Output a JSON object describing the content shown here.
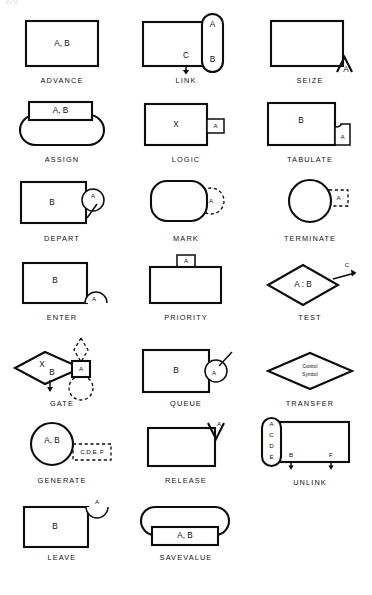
{
  "page": {
    "number": "370"
  },
  "document": {
    "title": "GPSS Block Symbols",
    "ink_color": "#0d0d0d",
    "paper_color": "#ffffff"
  },
  "rows": [
    {
      "cells": [
        {
          "name": "advance",
          "caption": "ADVANCE",
          "operands": [
            "A, B"
          ],
          "shape": "rectangle"
        },
        {
          "name": "link",
          "caption": "LINK",
          "operands": [
            "A",
            "B",
            "C"
          ],
          "shape": "rectangle-with-capsule"
        },
        {
          "name": "seize",
          "caption": "SEIZE",
          "operands": [
            "A"
          ],
          "shape": "rectangle-with-caret"
        }
      ]
    },
    {
      "cells": [
        {
          "name": "assign",
          "caption": "ASSIGN",
          "operands": [
            "A, B"
          ],
          "shape": "rectangle-over-capsule"
        },
        {
          "name": "logic",
          "caption": "LOGIC",
          "operands": [
            "X",
            "A"
          ],
          "shape": "rectangle-with-tab"
        },
        {
          "name": "tabulate",
          "caption": "TABULATE",
          "operands": [
            "B",
            "A"
          ],
          "shape": "rectangle-with-dogear"
        }
      ]
    },
    {
      "cells": [
        {
          "name": "depart",
          "caption": "DEPART",
          "operands": [
            "B",
            "A"
          ],
          "shape": "rectangle-with-circle"
        },
        {
          "name": "mark",
          "caption": "MARK",
          "operands": [
            "A"
          ],
          "shape": "capsule-with-dashed-circle"
        },
        {
          "name": "terminate",
          "caption": "TERMINATE",
          "operands": [
            "A"
          ],
          "shape": "circle-with-dashed-box"
        }
      ]
    },
    {
      "cells": [
        {
          "name": "enter",
          "caption": "ENTER",
          "operands": [
            "B",
            "A"
          ],
          "shape": "rectangle-with-semicircle"
        },
        {
          "name": "priority",
          "caption": "PRIORITY",
          "operands": [
            "A"
          ],
          "shape": "rectangle-with-top-tab"
        },
        {
          "name": "test",
          "caption": "TEST",
          "operands": [
            "A : B",
            "C"
          ],
          "shape": "diamond-with-arrow"
        }
      ]
    },
    {
      "cells": [
        {
          "name": "gate",
          "caption": "GATE",
          "operands": [
            "X",
            "B",
            "A"
          ],
          "shape": "diamond-with-box"
        },
        {
          "name": "queue",
          "caption": "QUEUE",
          "operands": [
            "B",
            "A"
          ],
          "shape": "rectangle-with-circle"
        },
        {
          "name": "transfer",
          "caption": "TRANSFER",
          "operands": [
            "Control",
            "Symbol"
          ],
          "shape": "diamond"
        }
      ]
    },
    {
      "cells": [
        {
          "name": "generate",
          "caption": "GENERATE",
          "operands": [
            "A, B",
            "C,D,E, F"
          ],
          "shape": "circle-with-dashed-box"
        },
        {
          "name": "release",
          "caption": "RELEASE",
          "operands": [
            "A"
          ],
          "shape": "rectangle-with-vee"
        },
        {
          "name": "unlink",
          "caption": "UNLINK",
          "operands": [
            "A",
            "C",
            "D",
            "E",
            "B",
            "F"
          ],
          "shape": "capsule-with-rectangle"
        }
      ]
    },
    {
      "cells": [
        {
          "name": "leave",
          "caption": "LEAVE",
          "operands": [
            "B",
            "A"
          ],
          "shape": "rectangle-with-arc"
        },
        {
          "name": "savevalue",
          "caption": "SAVEVALUE",
          "operands": [
            "A, B"
          ],
          "shape": "capsule-over-rectangle"
        }
      ]
    }
  ],
  "labels": {
    "advance_ab": "A, B",
    "link_a": "A",
    "link_b": "B",
    "link_c": "C",
    "seize_a": "A",
    "assign_ab": "A, B",
    "logic_x": "X",
    "logic_a": "A",
    "tabulate_b": "B",
    "tabulate_a": "A",
    "depart_b": "B",
    "depart_a": "A",
    "mark_a": "A",
    "terminate_a": "A",
    "enter_b": "B",
    "enter_a": "A",
    "priority_a": "A",
    "test_ab": "A : B",
    "test_c": "C",
    "gate_x": "X",
    "gate_b": "B",
    "gate_a": "A",
    "queue_b": "B",
    "queue_a": "A",
    "transfer_line1": "Control",
    "transfer_line2": "Symbol",
    "generate_ab": "A, B",
    "generate_cdef": "C,D,E, F",
    "release_a": "A",
    "unlink_a": "A",
    "unlink_c": "C",
    "unlink_d": "D",
    "unlink_e": "E",
    "unlink_b": "B",
    "unlink_f": "F",
    "leave_b": "B",
    "leave_a": "A",
    "savevalue_ab": "A, B"
  }
}
